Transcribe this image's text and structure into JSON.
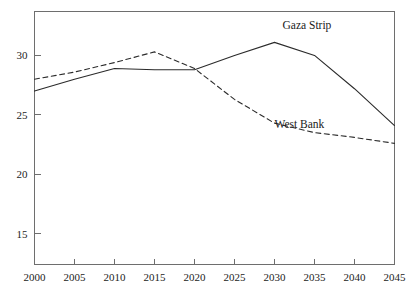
{
  "chart_data": {
    "type": "line",
    "title": "",
    "subtitle": "",
    "xlabel": "",
    "ylabel": "",
    "x": [
      2000,
      2005,
      2010,
      2015,
      2020,
      2025,
      2030,
      2035,
      2040,
      2045
    ],
    "xlim": [
      2000,
      2045
    ],
    "ylim": [
      12.4,
      33.7
    ],
    "xticks": [
      2000,
      2005,
      2010,
      2015,
      2020,
      2025,
      2030,
      2035,
      2040,
      2045
    ],
    "xtick_labels": [
      "2000",
      "2005",
      "2010",
      "2015",
      "2020",
      "2025",
      "2030",
      "2035",
      "2040",
      "2045"
    ],
    "yticks": [
      15,
      20,
      25,
      30
    ],
    "ytick_labels": [
      "15",
      "20",
      "25",
      "30"
    ],
    "grid": false,
    "legend_position": "inline-annotations",
    "series": [
      {
        "name": "Gaza Strip",
        "style": "solid",
        "color": "#2b2b2b",
        "values": [
          27.0,
          28.0,
          28.9,
          28.8,
          28.8,
          30.0,
          31.1,
          30.0,
          27.2,
          24.1
        ],
        "label_x": 2031,
        "label_y": 32.2
      },
      {
        "name": "West Bank",
        "style": "dashed",
        "color": "#2b2b2b",
        "values": [
          28.0,
          28.6,
          29.4,
          30.3,
          28.9,
          26.3,
          24.3,
          23.5,
          23.1,
          22.6
        ],
        "label_x": 2030,
        "label_y": 23.9
      }
    ]
  },
  "annotations": {
    "gaza_label": "Gaza Strip",
    "west_bank_label": "West Bank"
  }
}
